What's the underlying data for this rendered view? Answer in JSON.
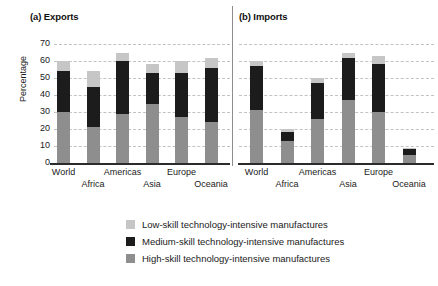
{
  "figure": {
    "ylabel": "Percentage",
    "panels": [
      {
        "key": "exports",
        "title": "(a) Exports"
      },
      {
        "key": "imports",
        "title": "(b) Imports"
      }
    ]
  },
  "axis": {
    "ticks": [
      "70",
      "60",
      "50",
      "40",
      "30",
      "20",
      "10",
      "0"
    ],
    "categories": [
      "World",
      "Africa",
      "Americas",
      "Asia",
      "Europe",
      "Oceania"
    ]
  },
  "legend": {
    "items": [
      {
        "label": "Low-skill technology-intensive manufactures",
        "color": "#c6c6c6",
        "name": "low-skill"
      },
      {
        "label": "Medium-skill technology-intensive manufactures",
        "color": "#1c1c1c",
        "name": "medium-skill"
      },
      {
        "label": "High-skill technology-intensive manufactures",
        "color": "#8e8e8e",
        "name": "high-skill"
      }
    ]
  },
  "chart_data": {
    "type": "bar",
    "subtype": "stacked-bar",
    "title": "",
    "panels": [
      {
        "name": "exports",
        "title": "(a) Exports",
        "categories": [
          "World",
          "Africa",
          "Americas",
          "Asia",
          "Europe",
          "Oceania"
        ],
        "series": [
          {
            "name": "High-skill technology-intensive manufactures",
            "color": "#8e8e8e",
            "values": [
              30,
              21,
              29,
              35,
              27,
              24
            ]
          },
          {
            "name": "Medium-skill technology-intensive manufactures",
            "color": "#1c1c1c",
            "values": [
              24,
              24,
              31,
              18,
              26,
              32
            ]
          },
          {
            "name": "Low-skill technology-intensive manufactures",
            "color": "#c6c6c6",
            "values": [
              6,
              9,
              5,
              5,
              7,
              6
            ]
          }
        ],
        "totals": [
          60,
          54,
          65,
          58,
          60,
          62
        ]
      },
      {
        "name": "imports",
        "title": "(b) Imports",
        "categories": [
          "World",
          "Africa",
          "Americas",
          "Asia",
          "Europe",
          "Oceania"
        ],
        "series": [
          {
            "name": "High-skill technology-intensive manufactures",
            "color": "#8e8e8e",
            "values": [
              31,
              13,
              26,
              37,
              30,
              5
            ]
          },
          {
            "name": "Medium-skill technology-intensive manufactures",
            "color": "#1c1c1c",
            "values": [
              26,
              5,
              21,
              25,
              28,
              3
            ]
          },
          {
            "name": "Low-skill technology-intensive manufactures",
            "color": "#c6c6c6",
            "values": [
              3,
              2,
              3,
              3,
              5,
              1
            ]
          }
        ],
        "totals": [
          60,
          20,
          50,
          65,
          63,
          9
        ]
      }
    ],
    "xlabel": "",
    "ylabel": "Percentage",
    "ylim": [
      0,
      70
    ],
    "ytick_step": 10,
    "grid": true,
    "legend_position": "bottom"
  }
}
